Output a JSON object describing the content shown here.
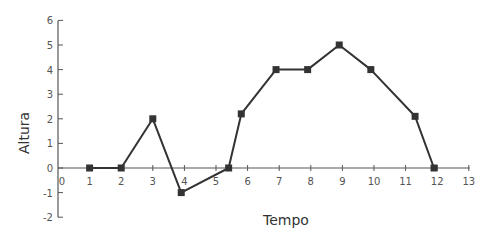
{
  "chart_data": {
    "type": "line",
    "title": "",
    "xlabel": "Tempo",
    "ylabel": "Altura",
    "xlim": [
      0,
      13
    ],
    "ylim": [
      -2,
      6
    ],
    "x_ticks": [
      0,
      1,
      2,
      3,
      4,
      5,
      6,
      7,
      8,
      9,
      10,
      11,
      12,
      13
    ],
    "y_ticks": [
      -2,
      -1,
      0,
      1,
      2,
      3,
      4,
      5,
      6
    ],
    "grid": false,
    "legend": null,
    "series": [
      {
        "name": "Altura",
        "marker": "square",
        "color": "#333333",
        "x": [
          1,
          2,
          3,
          3.9,
          5.4,
          5.8,
          6.9,
          7.9,
          8.9,
          9.9,
          11.3,
          11.9
        ],
        "y": [
          0,
          0,
          2,
          -1,
          0,
          2.2,
          4,
          4,
          5,
          4,
          2.1,
          0
        ]
      }
    ]
  },
  "colors": {
    "axis": "#555555",
    "line": "#333333",
    "marker": "#333333",
    "text": "#555555"
  }
}
